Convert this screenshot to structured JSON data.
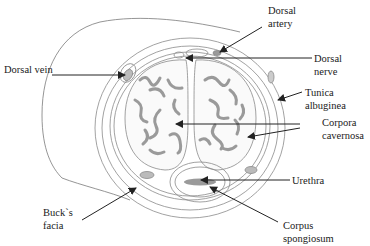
{
  "diagram": {
    "type": "anatomical cross-section",
    "labels": {
      "dorsal_artery": [
        "Dorsal",
        "artery"
      ],
      "dorsal_nerve": [
        "Dorsal",
        "nerve"
      ],
      "dorsal_vein": [
        "Dorsal vein"
      ],
      "tunica_albuginea": [
        "Tunica",
        "albuginea"
      ],
      "corpora_cavernosa": [
        "Corpora",
        "cavernosa"
      ],
      "urethra": [
        "Urethra"
      ],
      "bucks_facia": [
        "Buck`s",
        "facia"
      ],
      "corpus_spongiosum": [
        "Corpus",
        "spongiosum"
      ]
    },
    "colors": {
      "outline": "#8a8a8a",
      "tissue_fill": "#9a9a9a",
      "arrow": "#222222",
      "text": "#1a1a1a"
    }
  }
}
